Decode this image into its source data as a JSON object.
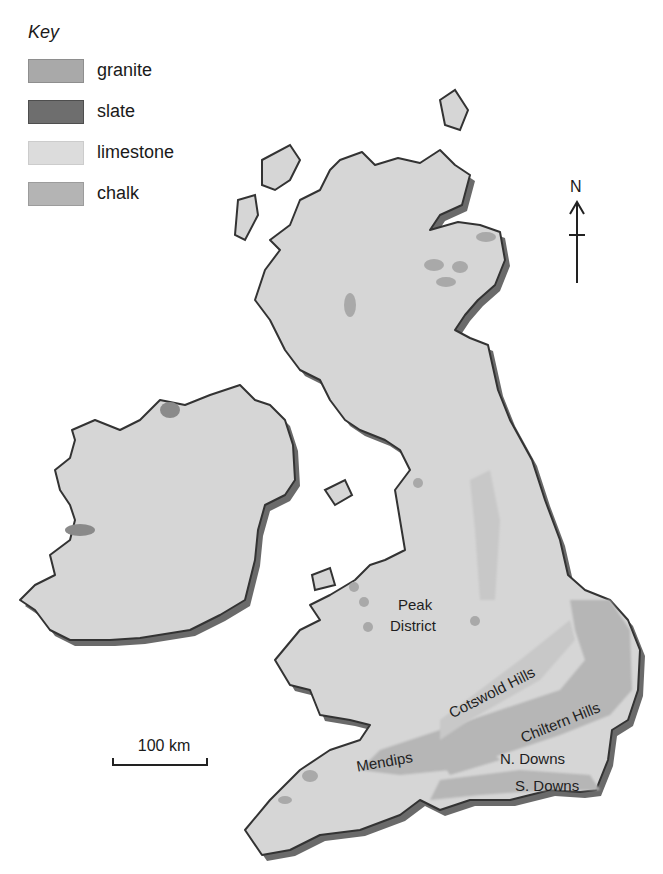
{
  "key": {
    "title": "Key",
    "items": [
      {
        "label": "granite",
        "color": "#a9a9a9",
        "border": "#8e8e8e"
      },
      {
        "label": "slate",
        "color": "#6e6e6e",
        "border": "#4e4e4e"
      },
      {
        "label": "limestone",
        "color": "#dcdcdc",
        "border": "#cccccc"
      },
      {
        "label": "chalk",
        "color": "#b4b4b4",
        "border": "#9c9c9c"
      }
    ]
  },
  "labels": {
    "peak": "Peak",
    "district": "District",
    "cotswold": "Cotswold Hills",
    "chiltern": "Chiltern Hills",
    "mendips": "Mendips",
    "n_downs": "N. Downs",
    "s_downs": "S. Downs"
  },
  "north_arrow": {
    "label": "N"
  },
  "scale_bar": {
    "label": "100 km"
  },
  "colors": {
    "land": "#d6d6d6",
    "coast": "#333333",
    "shadow": "#6a6a6a",
    "granite": "#a9a9a9",
    "chalk": "#b6b6b6",
    "limestone": "#dedede"
  }
}
